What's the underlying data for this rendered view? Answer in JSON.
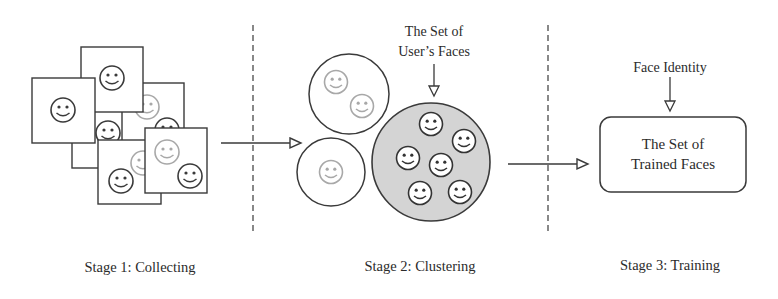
{
  "diagram": {
    "stages": [
      {
        "id": "stage1",
        "label": "Stage 1: Collecting"
      },
      {
        "id": "stage2",
        "label": "Stage 2: Clustering"
      },
      {
        "id": "stage3",
        "label": "Stage 3: Training"
      }
    ],
    "annotations": {
      "users_faces_line1": "The Set of",
      "users_faces_line2": "User’s Faces",
      "face_identity": "Face Identity"
    },
    "trained_box": {
      "line1": "The Set of",
      "line2": "Trained Faces"
    },
    "stage1_photos": [
      {
        "name": "photo-back-bottom",
        "x": 72,
        "y": 106,
        "w": 62,
        "h": 62,
        "faces": [
          {
            "cx": 108,
            "cy": 133,
            "faded": false
          }
        ]
      },
      {
        "name": "photo-back-right",
        "x": 122,
        "y": 83,
        "w": 62,
        "h": 66,
        "faces": [
          {
            "cx": 147,
            "cy": 107,
            "faded": true
          },
          {
            "cx": 167,
            "cy": 130,
            "faded": false
          }
        ]
      },
      {
        "name": "photo-top",
        "x": 81,
        "y": 47,
        "w": 62,
        "h": 65,
        "faces": [
          {
            "cx": 112,
            "cy": 78,
            "faded": false
          }
        ]
      },
      {
        "name": "photo-left",
        "x": 32,
        "y": 78,
        "w": 63,
        "h": 65,
        "faces": [
          {
            "cx": 63,
            "cy": 110,
            "faded": false
          }
        ]
      },
      {
        "name": "photo-bottom-mid",
        "x": 98,
        "y": 140,
        "w": 63,
        "h": 64,
        "faces": [
          {
            "cx": 143,
            "cy": 163,
            "faded": true
          },
          {
            "cx": 121,
            "cy": 181,
            "faded": false
          }
        ]
      },
      {
        "name": "photo-front-right",
        "x": 145,
        "y": 128,
        "w": 62,
        "h": 65,
        "faces": [
          {
            "cx": 167,
            "cy": 152,
            "faded": true
          },
          {
            "cx": 190,
            "cy": 176,
            "faded": false
          }
        ]
      }
    ],
    "stage2_clusters": [
      {
        "name": "cluster-small-top",
        "cx": 349,
        "cy": 94,
        "r": 40,
        "fill": "#ffffff",
        "faces": [
          {
            "cx": 336,
            "cy": 82
          },
          {
            "cx": 362,
            "cy": 106
          }
        ]
      },
      {
        "name": "cluster-small-bottom",
        "cx": 331,
        "cy": 172,
        "r": 34,
        "fill": "#ffffff",
        "faces": [
          {
            "cx": 331,
            "cy": 172
          }
        ]
      },
      {
        "name": "cluster-users-faces",
        "cx": 431,
        "cy": 162,
        "r": 59,
        "fill": "#d4d4d4",
        "faces": [
          {
            "cx": 431,
            "cy": 124
          },
          {
            "cx": 464,
            "cy": 141
          },
          {
            "cx": 408,
            "cy": 158
          },
          {
            "cx": 441,
            "cy": 165
          },
          {
            "cx": 420,
            "cy": 193
          },
          {
            "cx": 460,
            "cy": 192
          }
        ]
      }
    ],
    "colors": {
      "stroke": "#3a3a3a",
      "faded_stroke": "#a8a8a8",
      "cluster_fill": "#d4d4d4"
    }
  }
}
